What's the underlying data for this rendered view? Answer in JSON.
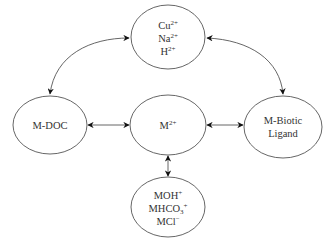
{
  "diagram": {
    "type": "metal speciation / biotic ligand model",
    "colors": {
      "stroke": "#555555",
      "arrowhead": "#111111",
      "text": "#333333",
      "background": "#ffffff"
    },
    "nodes": {
      "competing_cations": {
        "lines": [
          {
            "base": "Cu",
            "sup": "2+"
          },
          {
            "base": "Na",
            "sup": "2+"
          },
          {
            "base": "H",
            "sup": "2+"
          }
        ]
      },
      "m_doc": {
        "lines": [
          {
            "base": "M-DOC"
          }
        ]
      },
      "free_metal": {
        "lines": [
          {
            "base": "M",
            "sup": "2+"
          }
        ]
      },
      "m_biotic_ligand": {
        "lines": [
          {
            "base": "M-Biotic"
          },
          {
            "base": "Ligand"
          }
        ]
      },
      "inorganic_complexes": {
        "lines": [
          {
            "base": "MOH",
            "sup": "+"
          },
          {
            "base": "MHCO",
            "sub": "3",
            "sup": "+"
          },
          {
            "base": "MCl",
            "sup": "−"
          }
        ]
      }
    },
    "edges": [
      {
        "from": "competing_cations",
        "to": "m_doc",
        "style": "curved",
        "direction": "bidirectional"
      },
      {
        "from": "competing_cations",
        "to": "m_biotic_ligand",
        "style": "curved",
        "direction": "bidirectional"
      },
      {
        "from": "m_doc",
        "to": "free_metal",
        "style": "straight",
        "direction": "bidirectional"
      },
      {
        "from": "free_metal",
        "to": "m_biotic_ligand",
        "style": "straight",
        "direction": "bidirectional"
      },
      {
        "from": "free_metal",
        "to": "inorganic_complexes",
        "style": "straight",
        "direction": "bidirectional"
      }
    ]
  }
}
